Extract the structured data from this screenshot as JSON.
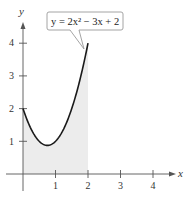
{
  "chart_data": {
    "type": "line",
    "title": "",
    "xlabel": "x",
    "ylabel": "y",
    "xlim": [
      0,
      4.5
    ],
    "ylim": [
      0,
      4.5
    ],
    "grid": false,
    "x_ticks": [
      1,
      2,
      3,
      4
    ],
    "y_ticks": [
      1,
      2,
      3,
      4
    ],
    "x_tick_labels": [
      "1",
      "2",
      "3",
      "4"
    ],
    "y_tick_labels": [
      "1",
      "2",
      "3",
      "4"
    ],
    "series": [
      {
        "name": "y = 2x^2 - 3x + 2",
        "equation": "y = 2x^2 - 3x + 2",
        "x": [
          0,
          0.25,
          0.5,
          0.75,
          1,
          1.25,
          1.5,
          1.75,
          2
        ],
        "values": [
          2,
          1.375,
          1,
          0.875,
          1,
          1.375,
          2,
          2.875,
          4
        ]
      }
    ],
    "shaded_region": {
      "from_x": 0,
      "to_x": 2,
      "under": "y = 2x^2 - 3x + 2",
      "color": "#ececec"
    },
    "annotations": [
      {
        "text": "y = 2x² − 3x + 2",
        "points_to": [
          1.9,
          3.75
        ]
      }
    ],
    "colors": {
      "curve": "#1a1a1a",
      "axis": "#555555",
      "shade": "#ececec",
      "callout_border": "#999999"
    }
  },
  "labels": {
    "x_axis": "x",
    "y_axis": "y",
    "callout": "y = 2x² − 3x + 2",
    "xticks": [
      "1",
      "2",
      "3",
      "4"
    ],
    "yticks": [
      "1",
      "2",
      "3",
      "4"
    ]
  }
}
